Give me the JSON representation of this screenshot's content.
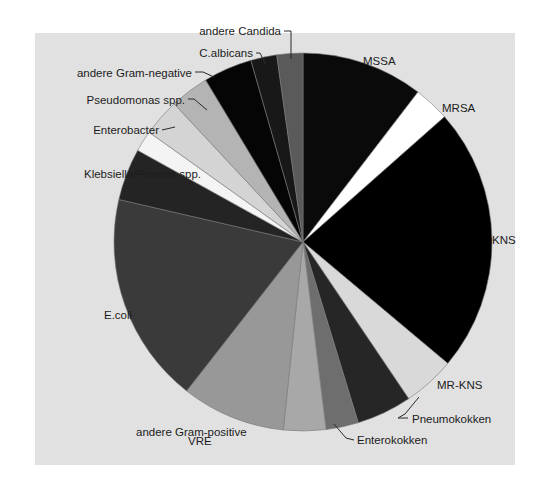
{
  "page": {
    "background": "#ffffff"
  },
  "panel": {
    "background": "#e1e1e1",
    "x": 35,
    "y": 33,
    "width": 480,
    "height": 432
  },
  "chart_data": {
    "type": "pie",
    "title": "",
    "legend_position": "labels-around-pie",
    "direction": "clockwise",
    "start_angle_deg": 0,
    "center": {
      "x": 303,
      "y": 242
    },
    "radius": 189,
    "slice_stroke_color": "#787878",
    "slice_stroke_width": 0.6,
    "label_color": "#1c1c1c",
    "pointer_color": "#2a2a2a",
    "slices": [
      {
        "label": "MSSA",
        "percent": 10.4,
        "start_deg": 0,
        "end_deg": 37.5,
        "color": "#0a0a0a"
      },
      {
        "label": "MRSA",
        "percent": 3.1,
        "start_deg": 37.5,
        "end_deg": 48.5,
        "color": "#ffffff"
      },
      {
        "label": "KNS",
        "percent": 22.6,
        "start_deg": 48.5,
        "end_deg": 130,
        "color": "#000000"
      },
      {
        "label": "MR-KNS",
        "percent": 4.4,
        "start_deg": 130,
        "end_deg": 146,
        "color": "#d9d9d9"
      },
      {
        "label": "Pneumokokken",
        "percent": 4.7,
        "start_deg": 146,
        "end_deg": 163,
        "color": "#262626"
      },
      {
        "label": "Enterokokken",
        "percent": 2.8,
        "start_deg": 163,
        "end_deg": 173,
        "color": "#6e6e6e"
      },
      {
        "label": "VRE",
        "percent": 3.6,
        "start_deg": 173,
        "end_deg": 186,
        "color": "#a8a8a8"
      },
      {
        "label": "andere Gram-positive",
        "percent": 8.9,
        "start_deg": 186,
        "end_deg": 218,
        "color": "#989898"
      },
      {
        "label": "E.coli",
        "percent": 18.1,
        "start_deg": 218,
        "end_deg": 283,
        "color": "#3a3a3a"
      },
      {
        "label": "Klebsiella/Proteus spp.",
        "percent": 4.4,
        "start_deg": 283,
        "end_deg": 299,
        "color": "#242424"
      },
      {
        "label": "",
        "percent": 1.8,
        "start_deg": 299,
        "end_deg": 305.5,
        "color": "#f4f4f4"
      },
      {
        "label": "Enterobacter",
        "percent": 3.2,
        "start_deg": 305.5,
        "end_deg": 317,
        "color": "#d4d4d4"
      },
      {
        "label": "Pseudomonas spp.",
        "percent": 3.3,
        "start_deg": 317,
        "end_deg": 329,
        "color": "#b4b4b4"
      },
      {
        "label": "andere Gram-negative",
        "percent": 4.2,
        "start_deg": 329,
        "end_deg": 344,
        "color": "#050505"
      },
      {
        "label": "C.albicans",
        "percent": 2.2,
        "start_deg": 344,
        "end_deg": 352,
        "color": "#181818"
      },
      {
        "label": "andere Candida",
        "percent": 2.2,
        "start_deg": 352,
        "end_deg": 360,
        "color": "#5a5a5a"
      }
    ],
    "labels": [
      {
        "text": "andere Candida",
        "x": 281,
        "y": 35,
        "anchor": "end",
        "pointer": [
          [
            284,
            31
          ],
          [
            291,
            31
          ],
          [
            291,
            59
          ]
        ]
      },
      {
        "text": "C.albicans",
        "x": 253,
        "y": 57,
        "anchor": "end",
        "pointer": [
          [
            256,
            53
          ],
          [
            260,
            53
          ],
          [
            266,
            65
          ]
        ]
      },
      {
        "text": "andere Gram-negative",
        "x": 192,
        "y": 77,
        "anchor": "end",
        "pointer": [
          [
            195,
            72
          ],
          [
            203,
            72
          ],
          [
            214,
            77
          ]
        ]
      },
      {
        "text": "Pseudomonas spp.",
        "x": 185,
        "y": 104,
        "anchor": "end",
        "pointer": [
          [
            188,
            99
          ],
          [
            194,
            99
          ],
          [
            207,
            110
          ]
        ]
      },
      {
        "text": "Enterobacter",
        "x": 159,
        "y": 134,
        "anchor": "end",
        "pointer": [
          [
            162,
            130
          ],
          [
            175,
            127
          ]
        ]
      },
      {
        "text": "Klebsiella/Proteus spp.",
        "x": 84,
        "y": 178,
        "anchor": "start",
        "pointer": null
      },
      {
        "text": "E.coli",
        "x": 104,
        "y": 319,
        "anchor": "start",
        "pointer": null
      },
      {
        "text": "andere Gram-positive",
        "x": 136,
        "y": 436,
        "anchor": "start",
        "pointer": null
      },
      {
        "text": "VRE",
        "x": 188,
        "y": 445,
        "anchor": "start",
        "pointer": null
      },
      {
        "text": "Enterokokken",
        "x": 357,
        "y": 444,
        "anchor": "start",
        "pointer": [
          [
            334,
            424
          ],
          [
            346,
            438
          ],
          [
            354,
            440
          ]
        ]
      },
      {
        "text": "Pneumokokken",
        "x": 412,
        "y": 423,
        "anchor": "start",
        "pointer": [
          [
            419,
            397
          ],
          [
            405,
            414
          ],
          [
            398,
            418
          ],
          [
            408,
            418
          ]
        ]
      },
      {
        "text": "MR-KNS",
        "x": 437,
        "y": 389,
        "anchor": "start",
        "pointer": null
      },
      {
        "text": "KNS",
        "x": 492,
        "y": 244,
        "anchor": "start",
        "pointer": null
      },
      {
        "text": "MRSA",
        "x": 442,
        "y": 112,
        "anchor": "start",
        "pointer": null
      },
      {
        "text": "MSSA",
        "x": 363,
        "y": 65,
        "anchor": "start",
        "pointer": null
      }
    ]
  }
}
